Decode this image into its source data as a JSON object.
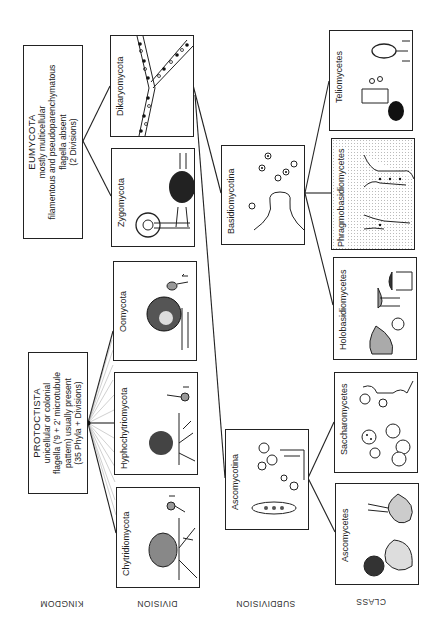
{
  "diagram": {
    "type": "taxonomic-tree",
    "orientation": "rotated-90-ccw",
    "ranks": [
      {
        "id": "kingdom",
        "label": "KINGDOM"
      },
      {
        "id": "division",
        "label": "DIVISION"
      },
      {
        "id": "subdivision",
        "label": "SUBDIVISION"
      },
      {
        "id": "class",
        "label": "CLASS"
      }
    ],
    "kingdoms": [
      {
        "id": "eumycota",
        "title": "EUMYCOTA",
        "lines": [
          "mostly multicellular",
          "filamentous and pseudoparenchymatous",
          "flagella absent",
          "(2 Divisions)"
        ]
      },
      {
        "id": "protoctista",
        "title": "PROTOCTISTA",
        "lines": [
          "unicellular or colonial",
          "flagella ('9 + 2' microtubule",
          "pattern) usually present",
          "(35 Phyla + Divisions)"
        ]
      }
    ],
    "divisions": [
      {
        "id": "dikaryomycota",
        "label": "Dikaryomycota",
        "parent": "eumycota"
      },
      {
        "id": "zygomycota",
        "label": "Zygomycota",
        "parent": "eumycota"
      },
      {
        "id": "oomycota",
        "label": "Oomycota",
        "parent": "protoctista"
      },
      {
        "id": "hyphochytriomycota",
        "label": "Hyphochytriomycota",
        "parent": "protoctista"
      },
      {
        "id": "chytridiomycota",
        "label": "Chytridiomycota",
        "parent": "protoctista"
      }
    ],
    "subdivisions": [
      {
        "id": "basidiomycotina",
        "label": "Basidiomycotina",
        "parent": "dikaryomycota"
      },
      {
        "id": "ascomycotina",
        "label": "Ascomycotina",
        "parent": "dikaryomycota"
      }
    ],
    "classes": [
      {
        "id": "teliomycetes",
        "label": "Teliomycetes",
        "parent": "basidiomycotina"
      },
      {
        "id": "phragmobasidiomycetes",
        "label": "Phragmobasidiomycetes",
        "parent": "basidiomycotina"
      },
      {
        "id": "holobasidiomycetes",
        "label": "Holobasidiomycetes",
        "parent": "basidiomycotina"
      },
      {
        "id": "saccharomycetes",
        "label": "Saccharomycetes",
        "parent": "ascomycotina"
      },
      {
        "id": "ascomycetes",
        "label": "Ascomycetes",
        "parent": "ascomycotina"
      }
    ]
  }
}
